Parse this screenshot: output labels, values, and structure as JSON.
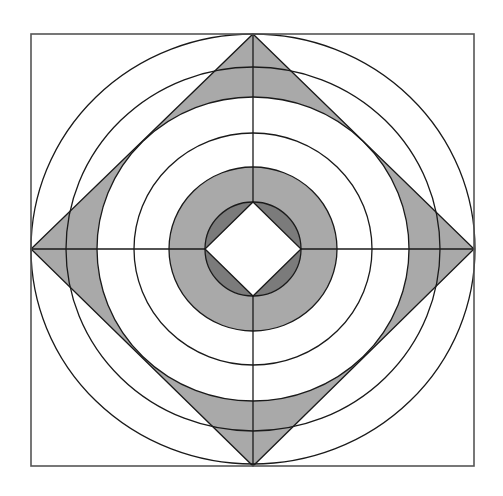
{
  "diagram": {
    "type": "geometric-pattern",
    "colors": {
      "background": "#ffffff",
      "line": "#1a1a1a",
      "frame": "#555555",
      "light_fill": "#a9a9a9",
      "dark_fill": "#7b7b7b"
    },
    "square": {
      "x1": 31,
      "y1": 34,
      "x2": 474,
      "y2": 466
    },
    "center": {
      "x": 253,
      "y": 249
    },
    "circles": [
      {
        "rx": 222,
        "ry": 215
      },
      {
        "rx": 187,
        "ry": 182
      },
      {
        "rx": 156,
        "ry": 152
      },
      {
        "rx": 119,
        "ry": 116
      },
      {
        "rx": 84,
        "ry": 82
      },
      {
        "rx": 48,
        "ry": 47
      }
    ],
    "outer_diamond": {
      "top": [
        253,
        34
      ],
      "right": [
        474,
        249
      ],
      "bottom": [
        253,
        466
      ],
      "left": [
        31,
        249
      ]
    },
    "inner_diamond": {
      "top": [
        253,
        202
      ],
      "right": [
        301,
        249
      ],
      "bottom": [
        253,
        296
      ],
      "left": [
        205,
        249
      ]
    },
    "shaded_regions": [
      "outer diamond minus third circle (light gray)",
      "ring between fifth and sixth circle (light gray)",
      "innermost circle minus inner diamond (dark gray)"
    ]
  }
}
